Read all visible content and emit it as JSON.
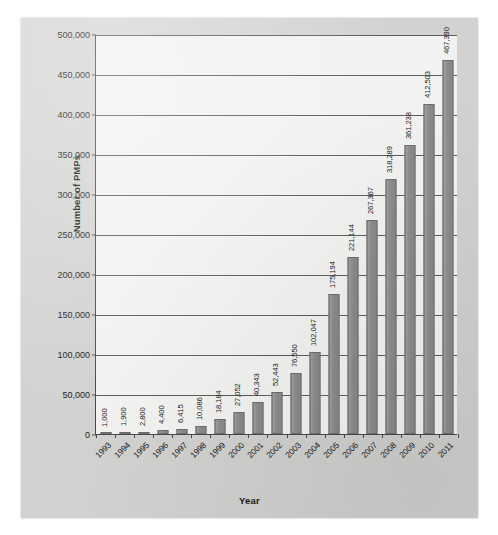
{
  "chart_data": {
    "type": "bar",
    "title": "",
    "xlabel": "Year",
    "ylabel": "Number of PMPs",
    "categories": [
      "1993",
      "1994",
      "1995",
      "1996",
      "1997",
      "1998",
      "1999",
      "2000",
      "2001",
      "2002",
      "2003",
      "2004",
      "2005",
      "2006",
      "2007",
      "2008",
      "2009",
      "2010",
      "2011"
    ],
    "values": [
      1000,
      1900,
      2800,
      4400,
      6415,
      10086,
      18184,
      27052,
      40343,
      52443,
      76550,
      102047,
      175194,
      221144,
      267367,
      318289,
      361238,
      412503,
      467390
    ],
    "value_labels": [
      "1,000",
      "1,900",
      "2,800",
      "4,400",
      "6,415",
      "10,086",
      "18,184",
      "27,052",
      "40,343",
      "52,443",
      "76,550",
      "102,047",
      "175,194",
      "221,144",
      "267,367",
      "318,289",
      "361,238",
      "412,503",
      "467,390"
    ],
    "ylim": [
      0,
      500000
    ],
    "ytick_values": [
      0,
      50000,
      100000,
      150000,
      200000,
      250000,
      300000,
      350000,
      400000,
      450000,
      500000
    ],
    "ytick_labels": [
      "0",
      "50,000",
      "100,000",
      "150,000",
      "200,000",
      "250,000",
      "300,000",
      "350,000",
      "400,000",
      "450,000",
      "500,000"
    ],
    "grid": "horizontal",
    "legend": "none",
    "colors": {
      "bar_fill": "#8d8d8d",
      "bar_stroke": "#6e6e6e",
      "plot_background": "#f2f2f0",
      "page_background": "#d3d3d1",
      "axis": "#4a4a4a",
      "gridline": "#5c5c5c",
      "text": "#1b1b1b"
    }
  }
}
